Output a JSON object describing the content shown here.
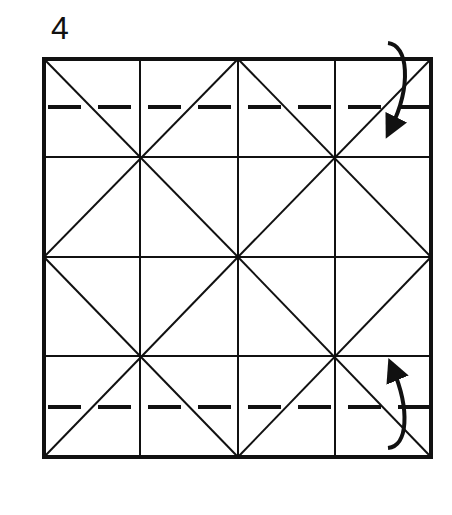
{
  "step": {
    "number": "4"
  },
  "diagram": {
    "type": "origami-crease-pattern",
    "square": {
      "x": 44,
      "y": 59,
      "width": 387,
      "height": 398
    },
    "grid": {
      "columns": 4,
      "rows": 4,
      "x_lines": [
        44,
        140,
        238,
        335,
        431
      ],
      "y_lines": [
        59,
        157,
        257,
        356,
        457
      ]
    },
    "diagonals": "X in each 2x2 quadrant",
    "valley_folds": [
      {
        "name": "top-valley-fold",
        "y": 107,
        "dash": [
          33,
          17
        ]
      },
      {
        "name": "bottom-valley-fold",
        "y": 407,
        "dash": [
          33,
          17
        ]
      }
    ],
    "arrows": [
      {
        "name": "fold-down-arrow",
        "direction": "down"
      },
      {
        "name": "fold-up-arrow",
        "direction": "up"
      }
    ],
    "colors": {
      "line": "#111111",
      "background": "#ffffff"
    }
  }
}
